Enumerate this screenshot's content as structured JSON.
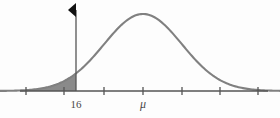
{
  "figure": {
    "title": "",
    "background_color": "#fdfdfd"
  },
  "labels": {
    "threshold": "16",
    "mean": "μ"
  },
  "colors": {
    "curve": "#808080",
    "shading": "#8a8a8a",
    "axis": "#555555",
    "marker": "#111111",
    "text": "#4a4a4a"
  },
  "chart_data": {
    "type": "line",
    "title": "",
    "xlabel": "",
    "ylabel": "",
    "grid": false,
    "legend": null,
    "axis": {
      "y_baseline_px": 91,
      "x_start_px": 20,
      "x_end_px": 268,
      "tick_positions_px": [
        26,
        64,
        104,
        143,
        182,
        220,
        258
      ],
      "tick_labels": [
        "",
        "",
        "",
        "μ",
        "",
        "",
        ""
      ],
      "tick_spacing_px": 39
    },
    "distribution": {
      "name": "normal",
      "mean_px": 143,
      "sigma_px": 39,
      "peak_y_px": 14,
      "baseline_y_px": 91
    },
    "annotations": [
      {
        "name": "threshold-line",
        "label": "16",
        "x_px": 76,
        "top_y_px": 8,
        "marker": "left-pointing-triangle"
      },
      {
        "name": "mean-label",
        "label": "μ",
        "x_px": 143
      }
    ],
    "shaded_region": {
      "name": "left-tail",
      "from_px": 0,
      "to_px": 76,
      "description": "Area under the normal curve to the left of 16"
    },
    "x": [
      0,
      8,
      16,
      24,
      32,
      40,
      48,
      56,
      64,
      72,
      76,
      80,
      88,
      96,
      104,
      112,
      120,
      128,
      136,
      143,
      150,
      158,
      166,
      174,
      182,
      190,
      198,
      206,
      214,
      222,
      230,
      238,
      246,
      254,
      262,
      268
    ],
    "y": [
      91.0,
      90.9,
      90.8,
      90.5,
      90.1,
      89.4,
      88.4,
      86.9,
      84.8,
      82.0,
      80.2,
      78.3,
      73.7,
      68.1,
      61.6,
      54.6,
      47.4,
      40.4,
      33.8,
      28.5,
      24.3,
      20.4,
      17.6,
      15.4,
      14.0,
      14.5,
      16.3,
      19.3,
      23.4,
      28.7,
      34.9,
      42.0,
      49.6,
      57.5,
      65.2,
      70.0
    ]
  }
}
